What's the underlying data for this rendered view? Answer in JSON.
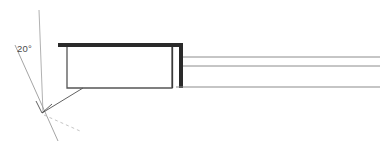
{
  "drawing": {
    "title": "Angled flange section detail",
    "background_color": "#ffffff",
    "width": 389,
    "height": 154,
    "annotations": {
      "angle_label": "20°",
      "angle_value": 20,
      "angle_unit": "degrees",
      "label_x": 17,
      "label_y": 52
    },
    "colors": {
      "heavy_line": "#2a2a2a",
      "medium_line": "#555555",
      "thin_line": "#8c8c8c",
      "construction_line": "#a8a8a8",
      "hidden_line": "#bdbdbd",
      "text": "#4a4a4a"
    },
    "geometry": {
      "vertical_datum": {
        "name": "vertical-reference-line",
        "x1": 39,
        "y1": 10,
        "x2": 43,
        "y2": 113
      },
      "angled_datum": {
        "name": "angled-reference-line",
        "x1": 15,
        "y1": 45,
        "x2": 58,
        "y2": 141
      },
      "vertex": {
        "x": 42,
        "y": 113
      },
      "angle_arc": {
        "name": "angle-arc-marker",
        "start_x": 36,
        "start_y": 101,
        "end_x": 52,
        "end_y": 104
      },
      "leader_line": {
        "name": "leader-line",
        "x1": 42,
        "y1": 113,
        "x2": 83,
        "y2": 88
      },
      "hidden_extension": {
        "name": "hidden-extension-line",
        "x1": 44,
        "y1": 115,
        "x2": 80,
        "y2": 131,
        "dash": "3 3"
      },
      "flange_box": {
        "name": "flange-body-outline",
        "left": 67,
        "top": 47,
        "right": 172,
        "bottom": 88
      },
      "top_plate": {
        "name": "top-plate-bar",
        "x1": 58,
        "y1": 45,
        "x2": 183,
        "y2": 45,
        "thickness": 4
      },
      "riser": {
        "name": "riser-vertical-bar",
        "x": 181,
        "top": 45,
        "bottom": 88,
        "thickness": 4
      },
      "web_lines": [
        {
          "name": "web-line-upper",
          "x1": 183,
          "y": 57,
          "x2": 380
        },
        {
          "name": "web-line-middle",
          "x1": 183,
          "y": 66,
          "x2": 380
        },
        {
          "name": "web-line-lower",
          "x1": 176,
          "y": 87,
          "x2": 380
        }
      ]
    }
  }
}
